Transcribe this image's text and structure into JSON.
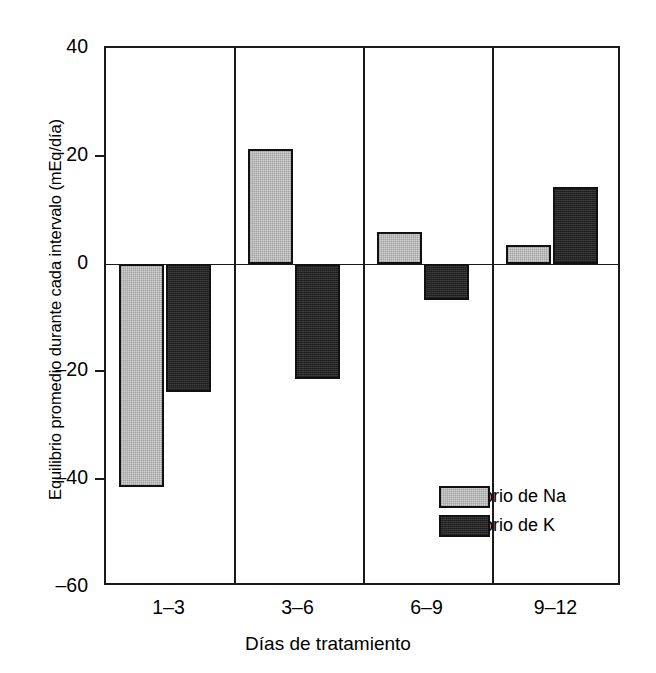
{
  "chart_data": {
    "type": "bar",
    "title": "",
    "subtitle": "",
    "xlabel": "Días de tratamiento",
    "ylabel": "Equilibrio promedio durante cada intervalo (mEq/día)",
    "categories": [
      "1–3",
      "3–6",
      "6–9",
      "9–12"
    ],
    "series": [
      {
        "name": "Equilibrio de Na",
        "color": "#d2d2d2",
        "values": [
          -41.4,
          21.2,
          5.8,
          3.4
        ]
      },
      {
        "name": "Equilibrio de K",
        "color": "#333333",
        "values": [
          -23.8,
          -21.4,
          -6.7,
          14.2
        ]
      }
    ],
    "ylim": [
      -60,
      40
    ],
    "yticks": [
      40,
      20,
      0,
      -20,
      -40,
      -60
    ],
    "ytick_labels": [
      "40",
      "20",
      "0",
      "–20",
      "–40",
      "–60"
    ],
    "grid": false,
    "group_dividers": true,
    "zero_line": true,
    "legend": {
      "position": "inside-lower-right",
      "entries": [
        {
          "label": "Equilibrio de Na",
          "color": "#d2d2d2",
          "swatch": "light-gray-hatched"
        },
        {
          "label": "Equilibrio de K",
          "color": "#333333",
          "swatch": "dark-gray-hatched"
        }
      ]
    }
  },
  "axis": {
    "y_title": "Equilibrio promedio durante cada intervalo (mEq/día)",
    "x_title": "Días de tratamiento"
  },
  "colors": {
    "na_fill": "#d2d2d2",
    "k_fill": "#333333",
    "frame": "#1a1a1a",
    "background": "#ffffff"
  }
}
